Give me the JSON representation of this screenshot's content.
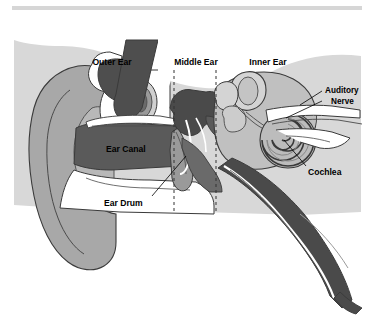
{
  "document": {
    "figure_type": "anatomical-diagram",
    "subject": "Cross-section of the human ear",
    "top_rule_color": "#d6d6d6"
  },
  "palette": {
    "background": "#ffffff",
    "tissue_light": "#d4d4d4",
    "tissue_mid": "#a8a8a8",
    "tissue_dark": "#5a5a5a",
    "tissue_darkest": "#3f3f3f",
    "outline": "#3a3a3a",
    "white": "#ffffff",
    "text": "#000000",
    "divider": "#333333"
  },
  "regions": {
    "outer_ear": {
      "label": "Outer Ear",
      "x": 112,
      "y": 62
    },
    "middle_ear": {
      "label": "Middle Ear",
      "x": 176,
      "y": 62
    },
    "inner_ear": {
      "label": "Inner Ear",
      "x": 258,
      "y": 62
    }
  },
  "dividers": [
    {
      "name": "outer-middle-divider",
      "x": 174,
      "y1": 70,
      "y2": 212
    },
    {
      "name": "middle-inner-divider",
      "x": 216,
      "y1": 70,
      "y2": 212
    }
  ],
  "parts": [
    {
      "name": "ear-canal",
      "label": "Ear Canal",
      "x": 106,
      "y": 148,
      "text_color": "#000000",
      "has_leader": false
    },
    {
      "name": "ear-drum",
      "label": "Ear Drum",
      "x": 113,
      "y": 203,
      "text_color": "#000000",
      "has_leader": true
    },
    {
      "name": "auditory-nerve",
      "label_line_1": "Auditory",
      "label_line_2": "Nerve",
      "x": 326,
      "y": 93,
      "text_color": "#000000",
      "has_leader": true
    },
    {
      "name": "cochlea",
      "label": "Cochlea",
      "x": 313,
      "y": 172,
      "text_color": "#000000",
      "has_leader": true
    }
  ]
}
